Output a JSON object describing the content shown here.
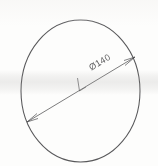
{
  "drawing": {
    "title": "Circle with diameter dimension",
    "medium": "scanned pencil sketch",
    "paper_color": "#fdfdfc",
    "ink_color": "#3a3a3c",
    "shapes": {
      "circle": {
        "name": "outer-circle",
        "center_x": 80.5,
        "center_y": 91,
        "radius_x": 59.5,
        "radius_y": 71,
        "stroke_width": 1.0
      },
      "diameter_line": {
        "name": "diameter-dimension-line",
        "x1": 27,
        "y1": 122,
        "x2": 135,
        "y2": 57,
        "angle_deg": -31,
        "stroke_width": 0.9,
        "arrowheads": "both-ends"
      },
      "center_tick": {
        "name": "center-tick-mark",
        "x1": 78,
        "y1": 79,
        "x2": 80,
        "y2": 91
      }
    },
    "labels": {
      "diameter": {
        "text": "Ø140",
        "symbol": "Ø",
        "value": "140",
        "x": 92,
        "y": 70,
        "rotation_deg": -31,
        "font_size": 9
      }
    }
  }
}
